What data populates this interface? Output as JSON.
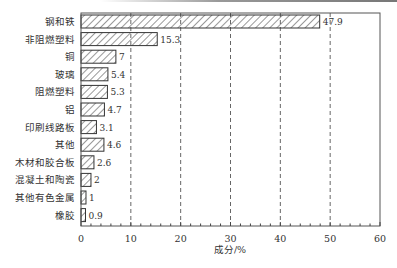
{
  "chart_data": {
    "type": "bar",
    "orientation": "horizontal",
    "title": "",
    "xlabel": "成分/%",
    "ylabel": "",
    "xlim": [
      0,
      60
    ],
    "xticks": [
      0,
      10,
      20,
      30,
      40,
      50,
      60
    ],
    "grid": "vertical dashed at 10,20,30,40,50",
    "bar_pattern": "diagonal hatch",
    "categories": [
      "钢和铁",
      "非阻燃塑料",
      "铜",
      "玻璃",
      "阻燃塑料",
      "铝",
      "印刷线路板",
      "其他",
      "木材和胶合板",
      "混凝土和陶瓷",
      "其他有色金属",
      "橡胶"
    ],
    "values": [
      47.9,
      15.3,
      7,
      5.4,
      5.3,
      4.7,
      3.1,
      4.6,
      2.6,
      2,
      1,
      0.9
    ],
    "value_labels": [
      "47.9",
      "15.3",
      "7",
      "5.4",
      "5.3",
      "4.7",
      "3.1",
      "4.6",
      "2.6",
      "2",
      "1",
      "0.9"
    ]
  },
  "axis": {
    "xlabel": "成分/%",
    "ticks": [
      "0",
      "10",
      "20",
      "30",
      "40",
      "50",
      "60"
    ]
  }
}
